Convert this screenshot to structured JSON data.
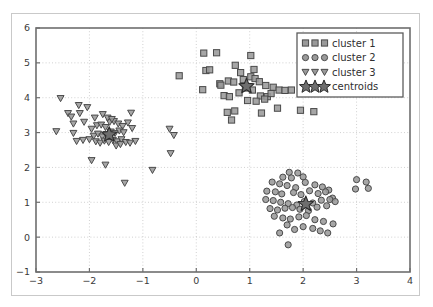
{
  "chart_data": {
    "type": "scatter",
    "title": "",
    "xlabel": "",
    "ylabel": "",
    "xlim": [
      -3,
      4
    ],
    "ylim": [
      -1,
      6
    ],
    "xticks": [
      -3,
      -2,
      -1,
      0,
      1,
      2,
      3,
      4
    ],
    "yticks": [
      -1,
      0,
      1,
      2,
      3,
      4,
      5,
      6
    ],
    "xtick_labels": [
      "−3",
      "−2",
      "−1",
      "0",
      "1",
      "2",
      "3",
      "4"
    ],
    "ytick_labels": [
      "−1",
      "0",
      "1",
      "2",
      "3",
      "4",
      "5",
      "6"
    ],
    "grid": true,
    "grid_style": "dotted",
    "grid_color": "#cccccc",
    "legend_position": "upper right",
    "marker_face_color": "#9a9a9a",
    "marker_edge_color": "#4a4a4a",
    "centroid_color": "#6e6e6e",
    "centroid_edge_color": "#2b2b2b",
    "axis_color": "#6e6e6e",
    "legend": [
      {
        "label": "cluster 1",
        "marker": "square"
      },
      {
        "label": "cluster 2",
        "marker": "circle"
      },
      {
        "label": "cluster 3",
        "marker": "triangle-down"
      },
      {
        "label": "centroids",
        "marker": "star"
      }
    ],
    "series": [
      {
        "name": "cluster 1",
        "marker": "square",
        "points": [
          [
            0.14,
            5.28
          ],
          [
            0.38,
            5.29
          ],
          [
            1.02,
            5.21
          ],
          [
            2.33,
            5.22
          ],
          [
            2.47,
            5.07
          ],
          [
            0.18,
            4.78
          ],
          [
            0.25,
            4.8
          ],
          [
            0.73,
            4.93
          ],
          [
            2.3,
            4.95
          ],
          [
            0.12,
            4.23
          ],
          [
            0.44,
            4.4
          ],
          [
            0.46,
            4.36
          ],
          [
            0.6,
            4.48
          ],
          [
            0.7,
            4.45
          ],
          [
            0.88,
            4.52
          ],
          [
            1.02,
            4.6
          ],
          [
            1.1,
            4.55
          ],
          [
            1.18,
            4.46
          ],
          [
            1.3,
            4.35
          ],
          [
            1.44,
            4.3
          ],
          [
            1.55,
            4.22
          ],
          [
            1.66,
            4.21
          ],
          [
            1.78,
            4.22
          ],
          [
            0.52,
            4.06
          ],
          [
            0.62,
            4.03
          ],
          [
            0.8,
            4.14
          ],
          [
            0.92,
            4.28
          ],
          [
            1.05,
            4.22
          ],
          [
            1.2,
            4.05
          ],
          [
            1.33,
            4.03
          ],
          [
            1.4,
            4.12
          ],
          [
            0.96,
            3.92
          ],
          [
            1.12,
            3.9
          ],
          [
            1.28,
            3.96
          ],
          [
            0.72,
            3.62
          ],
          [
            0.58,
            3.58
          ],
          [
            0.66,
            3.36
          ],
          [
            1.22,
            3.56
          ],
          [
            1.52,
            3.7
          ],
          [
            1.95,
            3.64
          ],
          [
            2.2,
            3.6
          ],
          [
            -0.32,
            4.63
          ],
          [
            0.83,
            4.72
          ],
          [
            1.08,
            4.81
          ]
        ]
      },
      {
        "name": "cluster 2",
        "marker": "circle",
        "points": [
          [
            1.74,
            1.86
          ],
          [
            1.9,
            1.84
          ],
          [
            1.62,
            1.72
          ],
          [
            1.78,
            1.7
          ],
          [
            2.0,
            1.73
          ],
          [
            1.42,
            1.58
          ],
          [
            1.56,
            1.53
          ],
          [
            1.7,
            1.48
          ],
          [
            1.86,
            1.42
          ],
          [
            2.04,
            1.57
          ],
          [
            2.22,
            1.5
          ],
          [
            2.36,
            1.44
          ],
          [
            2.48,
            1.35
          ],
          [
            1.32,
            1.32
          ],
          [
            1.48,
            1.3
          ],
          [
            1.6,
            1.24
          ],
          [
            1.82,
            1.28
          ],
          [
            1.96,
            1.22
          ],
          [
            2.12,
            1.33
          ],
          [
            2.28,
            1.25
          ],
          [
            2.42,
            1.3
          ],
          [
            2.55,
            1.12
          ],
          [
            1.3,
            1.08
          ],
          [
            1.44,
            1.05
          ],
          [
            1.58,
            1.0
          ],
          [
            1.72,
            0.96
          ],
          [
            1.88,
            0.92
          ],
          [
            2.02,
            1.02
          ],
          [
            2.18,
            0.98
          ],
          [
            2.34,
            1.06
          ],
          [
            2.5,
            1.08
          ],
          [
            2.6,
            1.02
          ],
          [
            1.38,
            0.82
          ],
          [
            1.52,
            0.78
          ],
          [
            1.66,
            0.83
          ],
          [
            1.8,
            0.85
          ],
          [
            1.94,
            0.8
          ],
          [
            2.1,
            0.76
          ],
          [
            2.26,
            0.86
          ],
          [
            2.44,
            0.9
          ],
          [
            1.46,
            0.6
          ],
          [
            1.62,
            0.55
          ],
          [
            1.76,
            0.52
          ],
          [
            1.92,
            0.58
          ],
          [
            2.06,
            0.62
          ],
          [
            2.22,
            0.5
          ],
          [
            2.38,
            0.45
          ],
          [
            2.56,
            0.38
          ],
          [
            1.56,
            0.12
          ],
          [
            1.7,
            0.35
          ],
          [
            1.84,
            0.22
          ],
          [
            2.0,
            0.3
          ],
          [
            2.18,
            0.25
          ],
          [
            2.32,
            0.18
          ],
          [
            2.46,
            0.12
          ],
          [
            1.72,
            -0.22
          ],
          [
            3.0,
            1.65
          ],
          [
            3.18,
            1.58
          ],
          [
            2.98,
            1.38
          ],
          [
            3.22,
            1.4
          ]
        ]
      },
      {
        "name": "cluster 3",
        "marker": "triangle-down",
        "points": [
          [
            -2.54,
            3.98
          ],
          [
            -2.2,
            3.78
          ],
          [
            -2.04,
            3.72
          ],
          [
            -1.75,
            3.52
          ],
          [
            -1.22,
            3.56
          ],
          [
            -2.62,
            3.03
          ],
          [
            -2.3,
            3.25
          ],
          [
            -2.18,
            3.55
          ],
          [
            -2.1,
            3.3
          ],
          [
            -2.24,
            2.75
          ],
          [
            -2.3,
            2.98
          ],
          [
            -2.12,
            2.78
          ],
          [
            -2.0,
            2.8
          ],
          [
            -1.96,
            3.1
          ],
          [
            -1.86,
            3.2
          ],
          [
            -1.78,
            3.22
          ],
          [
            -1.7,
            3.15
          ],
          [
            -1.62,
            3.3
          ],
          [
            -1.54,
            3.32
          ],
          [
            -1.46,
            3.25
          ],
          [
            -1.38,
            3.18
          ],
          [
            -1.92,
            2.9
          ],
          [
            -1.84,
            2.96
          ],
          [
            -1.76,
            2.88
          ],
          [
            -1.68,
            2.95
          ],
          [
            -1.6,
            3.02
          ],
          [
            -1.52,
            2.98
          ],
          [
            -1.44,
            3.05
          ],
          [
            -1.36,
            3.0
          ],
          [
            -1.88,
            2.74
          ],
          [
            -1.8,
            2.7
          ],
          [
            -1.72,
            2.76
          ],
          [
            -1.64,
            2.72
          ],
          [
            -1.56,
            2.78
          ],
          [
            -1.48,
            2.74
          ],
          [
            -1.4,
            2.8
          ],
          [
            -1.32,
            2.72
          ],
          [
            -1.28,
            3.28
          ],
          [
            -1.2,
            3.12
          ],
          [
            -1.14,
            2.75
          ],
          [
            -1.24,
            2.7
          ],
          [
            -1.96,
            2.2
          ],
          [
            -1.7,
            2.07
          ],
          [
            -1.34,
            1.55
          ],
          [
            -0.82,
            1.92
          ],
          [
            -0.5,
            3.1
          ],
          [
            -0.42,
            2.92
          ],
          [
            -0.48,
            2.4
          ],
          [
            -2.4,
            3.55
          ],
          [
            -2.34,
            3.45
          ],
          [
            -1.66,
            3.42
          ],
          [
            -1.58,
            3.38
          ],
          [
            -1.5,
            2.62
          ],
          [
            -1.42,
            2.66
          ],
          [
            -1.9,
            3.42
          ]
        ]
      }
    ],
    "centroids": [
      {
        "cluster": "cluster 1",
        "x": 0.94,
        "y": 4.33
      },
      {
        "cluster": "cluster 2",
        "x": 2.05,
        "y": 0.95
      },
      {
        "cluster": "cluster 3",
        "x": -1.63,
        "y": 2.94
      }
    ]
  }
}
